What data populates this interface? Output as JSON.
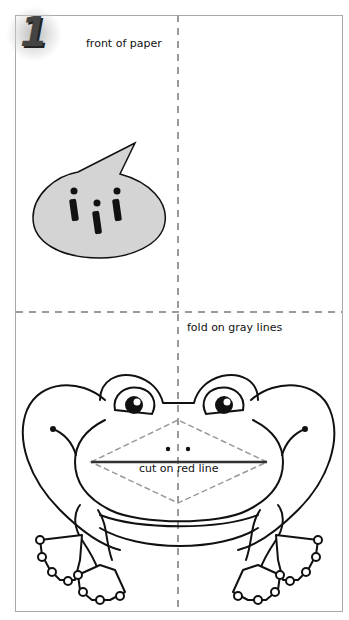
{
  "page": {
    "step_number": "1",
    "front_label": "front of paper",
    "fold_label": "fold on gray lines",
    "cut_label": "cut on red line"
  },
  "speech_bubble": {
    "text": "iii",
    "fill_color": "#d4d4d4"
  },
  "colors": {
    "fold_line": "#9a9a9a",
    "cut_line": "#333333",
    "outline": "#111111",
    "border": "#a8a8a8"
  },
  "icons": {
    "step_badge": "numbered-step-badge",
    "speech_bubble": "speech-bubble-icon",
    "frog": "frog-illustration"
  }
}
